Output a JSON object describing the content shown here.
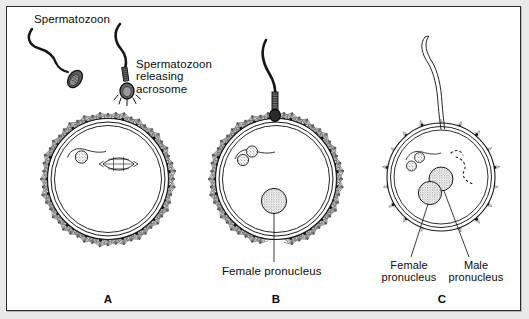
{
  "figure": {
    "title_visible": false,
    "background_color": "#ffffff",
    "ink_color": "#111111",
    "border_color": "#2b2b2b",
    "panel_count": 3
  },
  "labels": {
    "spermatozoon": "Spermatozoon",
    "spermatozoon_releasing_acrosome": "Spermatozoon\nreleasing\nacrosome",
    "female_pronucleus_b": "Female pronucleus",
    "female_pronucleus_c": "Female\npronucleus",
    "male_pronucleus_c": "Male\npronucleus"
  },
  "panels": [
    {
      "letter": "A",
      "caption": "",
      "features": [
        "free spermatozoon",
        "spermatozoon releasing acrosome",
        "corona radiata",
        "zona pellucida",
        "polar body",
        "meiotic spindle"
      ]
    },
    {
      "letter": "B",
      "caption": "Female pronucleus",
      "features": [
        "spermatozoon penetrating zona",
        "corona radiata",
        "zona pellucida",
        "two polar bodies",
        "female pronucleus"
      ]
    },
    {
      "letter": "C",
      "caption": "Female pronucleus / Male pronucleus",
      "features": [
        "degenerating sperm tail",
        "sparse corona radiata",
        "zona pellucida",
        "two polar bodies",
        "female pronucleus",
        "male pronucleus",
        "sperm tail remnant trail"
      ]
    }
  ],
  "diagram_geometry": {
    "panel_a": {
      "cx": 101,
      "cy": 172,
      "r_zona_outer": 66,
      "r_zona_inner": 62,
      "r_ooplasm": 58,
      "corona_len": 16
    },
    "panel_b": {
      "cx": 269,
      "cy": 172,
      "r_zona_outer": 66,
      "r_zona_inner": 62,
      "r_ooplasm": 58,
      "corona_len": 16
    },
    "panel_c": {
      "cx": 434,
      "cy": 170,
      "r_zona_outer": 58,
      "r_zona_inner": 54,
      "r_ooplasm": 50,
      "corona_len": 12
    }
  }
}
